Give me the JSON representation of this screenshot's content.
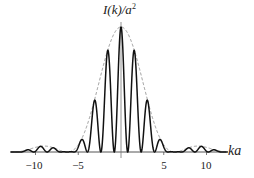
{
  "chart_data": {
    "type": "line",
    "title": "",
    "ylabel": "I(k)/a",
    "ylabel_sup": "2",
    "xlabel": "ka",
    "xticks": [
      -10,
      -5,
      5,
      10
    ],
    "xtick_labels": [
      "−10",
      "−5",
      "5",
      "10"
    ],
    "xlim": [
      -12.9,
      12.5
    ],
    "ylim": [
      0,
      1
    ],
    "grid": false,
    "legend": null,
    "series": [
      {
        "name": "intensity",
        "style": "solid",
        "color": "#111111",
        "formula": "sinc^2(ka/2) * cos^2(2ka)",
        "peaks": [
          {
            "x": -4.71,
            "y": 0.09
          },
          {
            "x": -3.14,
            "y": 0.405
          },
          {
            "x": -1.57,
            "y": 0.81
          },
          {
            "x": 0,
            "y": 1.0
          },
          {
            "x": 1.57,
            "y": 0.81
          },
          {
            "x": 3.14,
            "y": 0.405
          },
          {
            "x": 4.71,
            "y": 0.09
          },
          {
            "x": -9.42,
            "y": 0.045
          },
          {
            "x": 9.42,
            "y": 0.045
          }
        ]
      },
      {
        "name": "envelope",
        "style": "dashed",
        "color": "#888888",
        "formula": "sinc^2(ka/2)",
        "zeros": [
          -6.28,
          6.28,
          -12.57,
          12.57
        ]
      }
    ]
  },
  "labels": {
    "y_axis": "I(k)/a",
    "y_axis_sup": "2",
    "x_axis": "ka",
    "ticks": [
      "−10",
      "−5",
      "5",
      "10"
    ]
  }
}
